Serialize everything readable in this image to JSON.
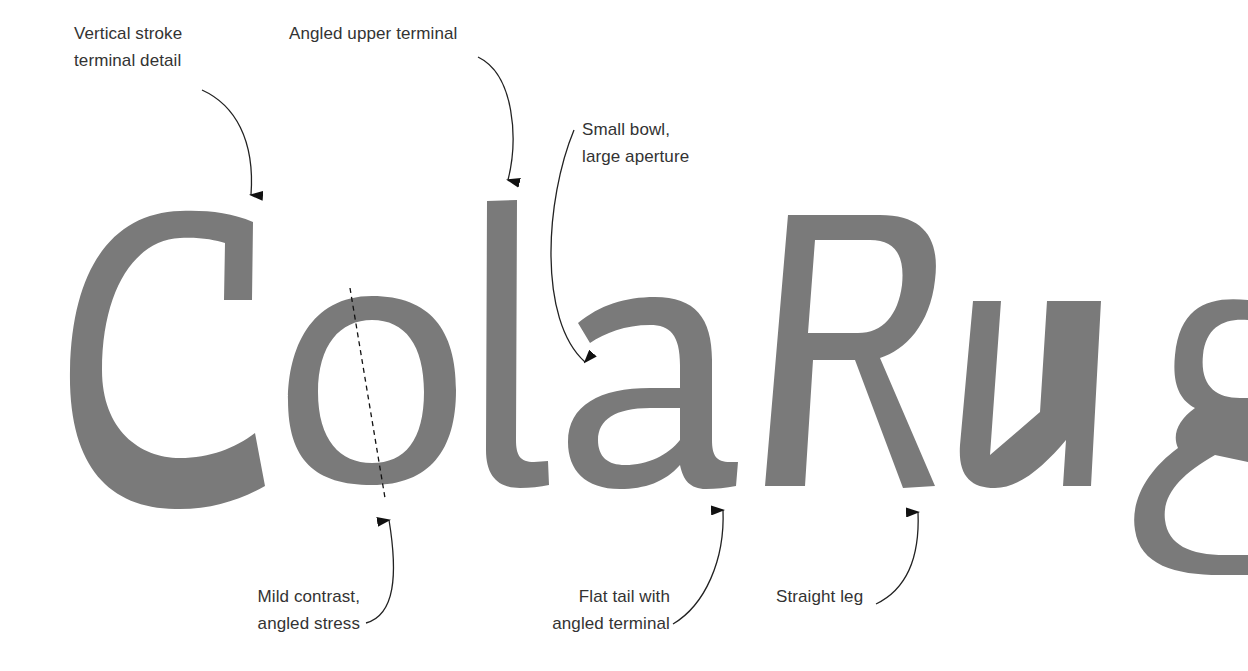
{
  "specimen": {
    "word": "ColaRug",
    "letters": [
      {
        "char": "C",
        "style": "roman"
      },
      {
        "char": "o",
        "style": "roman"
      },
      {
        "char": "l",
        "style": "roman"
      },
      {
        "char": "a",
        "style": "roman"
      },
      {
        "char": "R",
        "style": "italic"
      },
      {
        "char": "u",
        "style": "italic"
      },
      {
        "char": "g",
        "style": "italic"
      }
    ],
    "glyph_color": "#7a7a7a",
    "background": "#ffffff",
    "annotation_color": "#111111",
    "label_color": "#333333"
  },
  "annotations": {
    "vertical_stroke": {
      "line1": "Vertical stroke",
      "line2": "terminal detail",
      "target": "C"
    },
    "angled_upper": {
      "line1": "Angled upper terminal",
      "target": "l"
    },
    "small_bowl": {
      "line1": "Small bowl,",
      "line2": "large aperture",
      "target": "a"
    },
    "mild_contrast": {
      "line1": "Mild contrast,",
      "line2": "angled stress",
      "target": "o"
    },
    "flat_tail": {
      "line1": "Flat tail with",
      "line2": "angled terminal",
      "target": "a"
    },
    "straight_leg": {
      "line1": "Straight leg",
      "target": "R"
    }
  }
}
